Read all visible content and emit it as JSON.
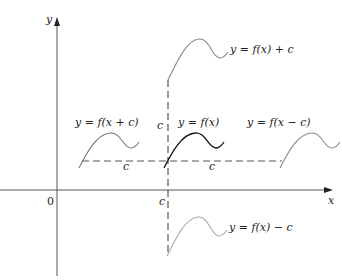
{
  "figure": {
    "axes": {
      "x_label": "x",
      "y_label": "y",
      "origin_label": "0"
    },
    "shift_label": "c",
    "curves": [
      {
        "id": "f",
        "label": "y = f(x)",
        "color": "#111111"
      },
      {
        "id": "f_plus_c",
        "label": "y = f(x) + c",
        "color": "#8a8a8a"
      },
      {
        "id": "f_minus_c",
        "label": "y = f(x) − c",
        "color": "#9a9a9a"
      },
      {
        "id": "f_x_plus_c",
        "label": "y = f(x + c)",
        "color": "#777777"
      },
      {
        "id": "f_x_minus_c",
        "label": "y = f(x − c)",
        "color": "#8a8a8a"
      }
    ]
  }
}
